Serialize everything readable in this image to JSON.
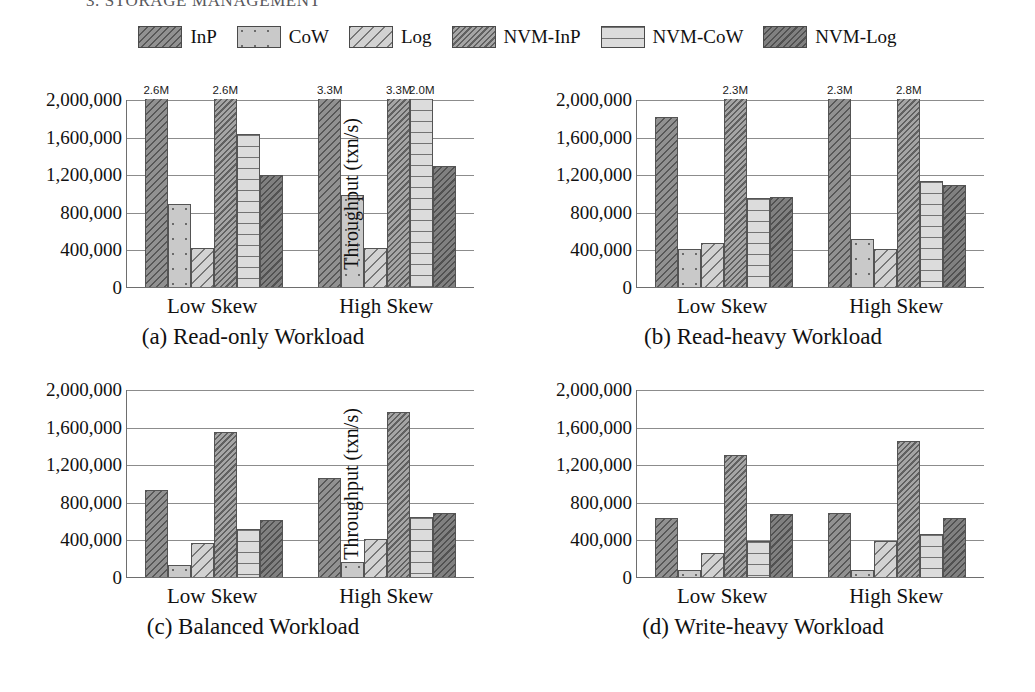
{
  "running_head": "3. STORAGE MANAGEMENT",
  "legend": {
    "entries": [
      {
        "label": "InP",
        "pattern": "p-inp"
      },
      {
        "label": "CoW",
        "pattern": "p-cow"
      },
      {
        "label": "Log",
        "pattern": "p-log"
      },
      {
        "label": "NVM-InP",
        "pattern": "p-nvminp"
      },
      {
        "label": "NVM-CoW",
        "pattern": "p-nvmcow"
      },
      {
        "label": "NVM-Log",
        "pattern": "p-nvmlog"
      }
    ]
  },
  "axis": {
    "ylabel": "Throughput (txn/s)",
    "yticks": [
      0,
      400000,
      800000,
      1200000,
      1600000,
      2000000
    ],
    "ytick_labels": [
      "0",
      "400,000",
      "800,000",
      "1,200,000",
      "1,600,000",
      "2,000,000"
    ],
    "ylim": [
      0,
      2000000
    ],
    "categories": [
      "Low Skew",
      "High Skew"
    ]
  },
  "chart_data": [
    {
      "id": "a",
      "type": "bar",
      "title": "(a) Read-only Workload",
      "xlabel": "",
      "ylabel": "Throughput (txn/s)",
      "ylim": [
        0,
        2000000
      ],
      "grid": true,
      "legend_position": "top-shared",
      "categories": [
        "Low Skew",
        "High Skew"
      ],
      "series": [
        {
          "name": "InP",
          "values": [
            2600000,
            3300000
          ],
          "clipped": [
            true,
            true
          ],
          "labels": [
            "2.6M",
            "3.3M"
          ]
        },
        {
          "name": "CoW",
          "values": [
            880000,
            980000
          ],
          "clipped": [
            false,
            false
          ],
          "labels": [
            "",
            ""
          ]
        },
        {
          "name": "Log",
          "values": [
            410000,
            415000
          ],
          "clipped": [
            false,
            false
          ],
          "labels": [
            "",
            ""
          ]
        },
        {
          "name": "NVM-InP",
          "values": [
            2600000,
            3300000
          ],
          "clipped": [
            true,
            true
          ],
          "labels": [
            "2.6M",
            "3.3M"
          ]
        },
        {
          "name": "NVM-CoW",
          "values": [
            1630000,
            2000000
          ],
          "clipped": [
            false,
            true
          ],
          "labels": [
            "",
            "2.0M"
          ]
        },
        {
          "name": "NVM-Log",
          "values": [
            1190000,
            1285000
          ],
          "clipped": [
            false,
            false
          ],
          "labels": [
            "",
            ""
          ]
        }
      ]
    },
    {
      "id": "b",
      "type": "bar",
      "title": "(b) Read-heavy Workload",
      "xlabel": "",
      "ylabel": "Throughput (txn/s)",
      "ylim": [
        0,
        2000000
      ],
      "grid": true,
      "legend_position": "top-shared",
      "categories": [
        "Low Skew",
        "High Skew"
      ],
      "series": [
        {
          "name": "InP",
          "values": [
            1810000,
            2300000
          ],
          "clipped": [
            false,
            true
          ],
          "labels": [
            "",
            "2.3M"
          ]
        },
        {
          "name": "CoW",
          "values": [
            405000,
            510000
          ],
          "clipped": [
            false,
            false
          ],
          "labels": [
            "",
            ""
          ]
        },
        {
          "name": "Log",
          "values": [
            470000,
            400000
          ],
          "clipped": [
            false,
            false
          ],
          "labels": [
            "",
            ""
          ]
        },
        {
          "name": "NVM-InP",
          "values": [
            2300000,
            2800000
          ],
          "clipped": [
            true,
            true
          ],
          "labels": [
            "2.3M",
            "2.8M"
          ]
        },
        {
          "name": "NVM-CoW",
          "values": [
            945000,
            1130000
          ],
          "clipped": [
            false,
            false
          ],
          "labels": [
            "",
            ""
          ]
        },
        {
          "name": "NVM-Log",
          "values": [
            955000,
            1080000
          ],
          "clipped": [
            false,
            false
          ],
          "labels": [
            "",
            ""
          ]
        }
      ]
    },
    {
      "id": "c",
      "type": "bar",
      "title": "(c) Balanced Workload",
      "xlabel": "",
      "ylabel": "Throughput (txn/s)",
      "ylim": [
        0,
        2000000
      ],
      "grid": true,
      "legend_position": "top-shared",
      "categories": [
        "Low Skew",
        "High Skew"
      ],
      "series": [
        {
          "name": "InP",
          "values": [
            930000,
            1050000
          ],
          "clipped": [
            false,
            false
          ],
          "labels": [
            "",
            ""
          ]
        },
        {
          "name": "CoW",
          "values": [
            125000,
            155000
          ],
          "clipped": [
            false,
            false
          ],
          "labels": [
            "",
            ""
          ]
        },
        {
          "name": "Log",
          "values": [
            360000,
            400000
          ],
          "clipped": [
            false,
            false
          ],
          "labels": [
            "",
            ""
          ]
        },
        {
          "name": "NVM-InP",
          "values": [
            1540000,
            1760000
          ],
          "clipped": [
            false,
            false
          ],
          "labels": [
            "",
            ""
          ]
        },
        {
          "name": "NVM-CoW",
          "values": [
            515000,
            640000
          ],
          "clipped": [
            false,
            false
          ],
          "labels": [
            "",
            ""
          ]
        },
        {
          "name": "NVM-Log",
          "values": [
            610000,
            685000
          ],
          "clipped": [
            false,
            false
          ],
          "labels": [
            "",
            ""
          ]
        }
      ]
    },
    {
      "id": "d",
      "type": "bar",
      "title": "(d) Write-heavy Workload",
      "xlabel": "",
      "ylabel": "Throughput (txn/s)",
      "ylim": [
        0,
        2000000
      ],
      "grid": true,
      "legend_position": "top-shared",
      "categories": [
        "Low Skew",
        "High Skew"
      ],
      "series": [
        {
          "name": "InP",
          "values": [
            630000,
            680000
          ],
          "clipped": [
            false,
            false
          ],
          "labels": [
            "",
            ""
          ]
        },
        {
          "name": "CoW",
          "values": [
            70000,
            70000
          ],
          "clipped": [
            false,
            false
          ],
          "labels": [
            "",
            ""
          ]
        },
        {
          "name": "Log",
          "values": [
            260000,
            380000
          ],
          "clipped": [
            false,
            false
          ],
          "labels": [
            "",
            ""
          ]
        },
        {
          "name": "NVM-InP",
          "values": [
            1300000,
            1450000
          ],
          "clipped": [
            false,
            false
          ],
          "labels": [
            "",
            ""
          ]
        },
        {
          "name": "NVM-CoW",
          "values": [
            380000,
            455000
          ],
          "clipped": [
            false,
            false
          ],
          "labels": [
            "",
            ""
          ]
        },
        {
          "name": "NVM-Log",
          "values": [
            670000,
            625000
          ],
          "clipped": [
            false,
            false
          ],
          "labels": [
            "",
            ""
          ]
        }
      ]
    }
  ]
}
